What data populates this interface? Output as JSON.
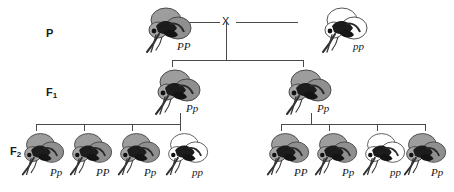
{
  "diagram": {
    "cross_symbol": "X",
    "body_colors": {
      "dominant_gray": "#9a9a9a",
      "recessive_white": "#ffffff",
      "outline": "#3c3c3c",
      "detail_dark": "#111111",
      "line": "#4a4a4a"
    }
  },
  "generations": [
    {
      "key": "P",
      "label": "P",
      "label_sub": "",
      "individuals": [
        {
          "genotype": "PP",
          "phenotype": "gray",
          "body": "gray"
        },
        {
          "genotype": "pp",
          "phenotype": "white",
          "body": "white"
        }
      ]
    },
    {
      "key": "F1",
      "label": "F",
      "label_sub": "1",
      "individuals": [
        {
          "genotype": "Pp",
          "phenotype": "gray",
          "body": "gray"
        },
        {
          "genotype": "Pp",
          "phenotype": "gray",
          "body": "gray"
        }
      ]
    },
    {
      "key": "F2",
      "label": "F",
      "label_sub": "2",
      "individuals": [
        {
          "genotype": "Pp",
          "phenotype": "gray",
          "body": "gray"
        },
        {
          "genotype": "PP",
          "phenotype": "gray",
          "body": "gray"
        },
        {
          "genotype": "Pp",
          "phenotype": "gray",
          "body": "gray"
        },
        {
          "genotype": "pp",
          "phenotype": "white",
          "body": "white"
        },
        {
          "genotype": "PP",
          "phenotype": "gray",
          "body": "gray"
        },
        {
          "genotype": "Pp",
          "phenotype": "gray",
          "body": "gray"
        },
        {
          "genotype": "pp",
          "phenotype": "white",
          "body": "white"
        },
        {
          "genotype": "Pp",
          "phenotype": "gray",
          "body": "gray"
        }
      ]
    }
  ]
}
